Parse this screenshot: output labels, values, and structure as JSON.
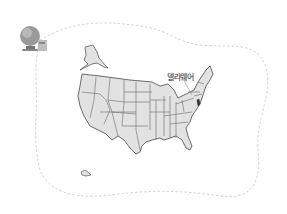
{
  "illustration": {
    "subject": "United States map",
    "highlighted_state_label": "델라웨어",
    "icon": "globe-icon",
    "colors": {
      "state_fill": "#e2e2e2",
      "state_border": "#5a5a5a",
      "highlight_fill": "#333333",
      "dashed_border": "#cfcfcf",
      "background": "#ffffff"
    }
  }
}
